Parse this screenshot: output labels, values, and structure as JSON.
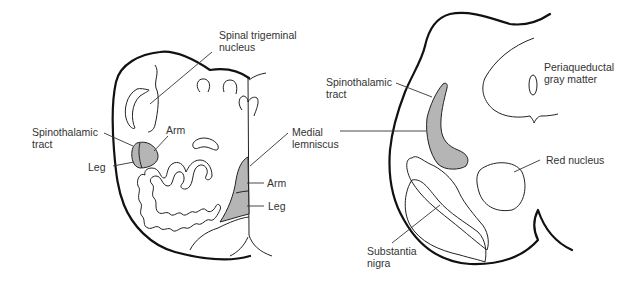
{
  "diagram": {
    "type": "anatomical cross-sections",
    "fill_color": "#b5b5b5",
    "panels": [
      {
        "id": "medulla",
        "labels": {
          "spinal_trigeminal": "Spinal trigeminal\nnucleus",
          "spinothalamic": "Spinothalamic\ntract",
          "arm_left": "Arm",
          "leg_left": "Leg",
          "medial_lemniscus": "Medial\nlemniscus",
          "arm_right": "Arm",
          "leg_right": "Leg"
        }
      },
      {
        "id": "midbrain",
        "labels": {
          "spinothalamic": "Spinothalamic\ntract",
          "periaqueductal": "Periaqueductal\ngray matter",
          "red_nucleus": "Red nucleus",
          "substantia_nigra": "Substantia\nnigra"
        }
      }
    ]
  }
}
